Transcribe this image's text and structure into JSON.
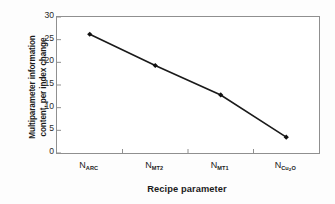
{
  "chart_data": {
    "type": "line",
    "title": "",
    "xlabel": "Recipe parameter",
    "ylabel": "Multiparameter information content, per index change",
    "ylabel_line1": "Multiparameter information",
    "ylabel_line2": "content, per index change",
    "categories": [
      "N_ARC",
      "N_MT2",
      "N_MT1",
      "N_Cu2O"
    ],
    "category_labels": [
      {
        "base": "N",
        "sub": "ARC",
        "sub2": ""
      },
      {
        "base": "N",
        "sub": "MT2",
        "sub2": ""
      },
      {
        "base": "N",
        "sub": "MT1",
        "sub2": ""
      },
      {
        "base": "N",
        "sub": "Cu",
        "sub2": "2",
        "sub3": "O"
      }
    ],
    "values": [
      26.2,
      19.3,
      12.8,
      3.5
    ],
    "ylim": [
      0,
      30
    ],
    "yticks": [
      0,
      5,
      10,
      15,
      20,
      25,
      30
    ],
    "ytick_labels": [
      "0",
      "5",
      "10",
      "15",
      "20",
      "25",
      "30"
    ],
    "grid": false,
    "legend": false,
    "marker": "diamond",
    "line_color": "#1a1a1a",
    "marker_color": "#111111",
    "axis_color": "#8f8f8f"
  }
}
